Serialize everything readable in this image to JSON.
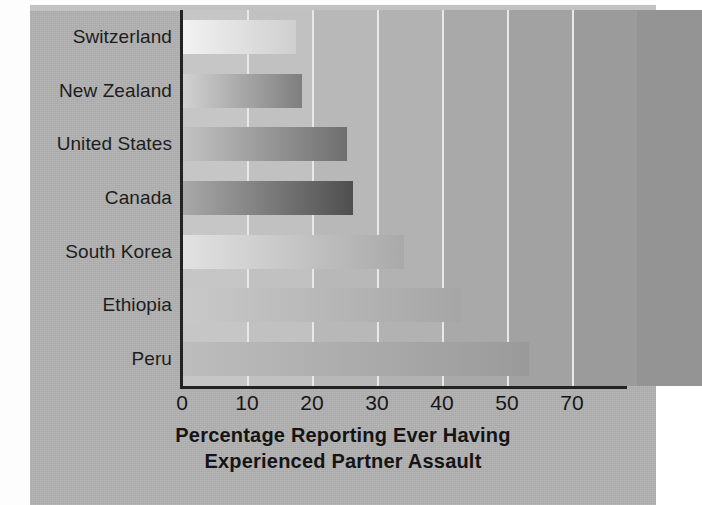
{
  "figure": {
    "background_color": "#b2b2b2",
    "page_color": "#fdfdfd",
    "axis_color": "#232323",
    "gridline_color": "#e8e8e8"
  },
  "axis_title": {
    "line1": "Percentage Reporting Ever Having",
    "line2": "Experienced Partner Assault"
  },
  "chart_data": {
    "type": "bar",
    "orientation": "horizontal",
    "title": "",
    "xlabel": "Percentage Reporting Ever Having Experienced Partner Assault",
    "ylabel": "",
    "categories": [
      "Switzerland",
      "New Zealand",
      "United States",
      "Canada",
      "South Korea",
      "Ethiopia",
      "Peru"
    ],
    "values": [
      20,
      21,
      29,
      30,
      39,
      49,
      61
    ],
    "series": [
      {
        "name": "Percentage Reporting Ever Having Experienced Partner Assault",
        "values": [
          20,
          21,
          29,
          30,
          39,
          49,
          61
        ]
      }
    ],
    "xlim": [
      0,
      78
    ],
    "ylim": null,
    "xticks": [
      0,
      10,
      20,
      30,
      40,
      50,
      70
    ],
    "xtick_labels": [
      "0",
      "10",
      "20",
      "30",
      "40",
      "50",
      "70"
    ],
    "grid": "vertical-only",
    "legend": null,
    "legend_position": "none",
    "annotations": [],
    "bar_styles": [
      {
        "category": "Switzerland",
        "gradient_from": "#f2f2f2",
        "gradient_to": "#cfcfcf"
      },
      {
        "category": "New Zealand",
        "gradient_from": "#d2d2d2",
        "gradient_to": "#7e7e7e"
      },
      {
        "category": "United States",
        "gradient_from": "#c3c3c3",
        "gradient_to": "#6f6f6f"
      },
      {
        "category": "Canada",
        "gradient_from": "#a9a9a9",
        "gradient_to": "#4f4f4f"
      },
      {
        "category": "South Korea",
        "gradient_from": "#e2e2e2",
        "gradient_to": "#a9a9a9"
      },
      {
        "category": "Ethiopia",
        "gradient_from": "#c9c9c9",
        "gradient_to": "#a6a6a6"
      },
      {
        "category": "Peru",
        "gradient_from": "#bdbdbd",
        "gradient_to": "#9a9a9a"
      }
    ],
    "background_columns": [
      "#c6c6c6",
      "#c1c1c1",
      "#b8b8b8",
      "#b2b2b2",
      "#a9a9a9",
      "#a2a2a2",
      "#9b9b9b",
      "#949494"
    ]
  }
}
